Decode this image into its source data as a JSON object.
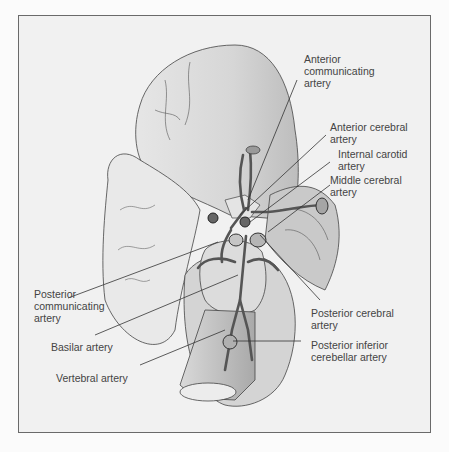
{
  "figure": {
    "labels": {
      "anterior_communicating": "Anterior\ncommunicating\nartery",
      "anterior_cerebral": "Anterior cerebral\nartery",
      "internal_carotid": "Internal carotid\nartery",
      "middle_cerebral": "Middle cerebral\nartery",
      "posterior_communicating": "Posterior\ncommunicating\nartery",
      "posterior_cerebral": "Posterior cerebral\nartery",
      "basilar": "Basilar artery",
      "posterior_inferior_cerebellar": "Posterior inferior\ncerebellar artery",
      "vertebral": "Vertebral artery"
    },
    "colors": {
      "frame_border": "#6a6a6a",
      "background": "#f1f1f1",
      "text": "#444444",
      "leader_line": "#333333"
    }
  }
}
